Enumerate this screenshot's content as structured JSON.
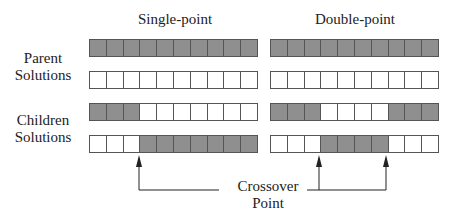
{
  "headers": {
    "single": "Single-point",
    "double": "Double-point"
  },
  "labels": {
    "parent": [
      "Parent",
      "Solutions"
    ],
    "children": [
      "Children",
      "Solutions"
    ],
    "crossover": [
      "Crossover",
      "Point"
    ]
  },
  "colors": {
    "shaded": "#8f8f8f",
    "empty": "#ffffff",
    "border": "#555555"
  },
  "single_point": {
    "parent1": [
      1,
      1,
      1,
      1,
      1,
      1,
      1,
      1,
      1,
      1
    ],
    "parent2": [
      0,
      0,
      0,
      0,
      0,
      0,
      0,
      0,
      0,
      0
    ],
    "child1": [
      1,
      1,
      1,
      0,
      0,
      0,
      0,
      0,
      0,
      0
    ],
    "child2": [
      0,
      0,
      0,
      1,
      1,
      1,
      1,
      1,
      1,
      1
    ],
    "crossover_index": 3
  },
  "double_point": {
    "parent1": [
      1,
      1,
      1,
      1,
      1,
      1,
      1,
      1,
      1,
      1
    ],
    "parent2": [
      0,
      0,
      0,
      0,
      0,
      0,
      0,
      0,
      0,
      0
    ],
    "child1": [
      1,
      1,
      1,
      0,
      0,
      0,
      0,
      1,
      1,
      1
    ],
    "child2": [
      0,
      0,
      0,
      1,
      1,
      1,
      1,
      0,
      0,
      0
    ],
    "crossover_indices": [
      3,
      7
    ]
  }
}
